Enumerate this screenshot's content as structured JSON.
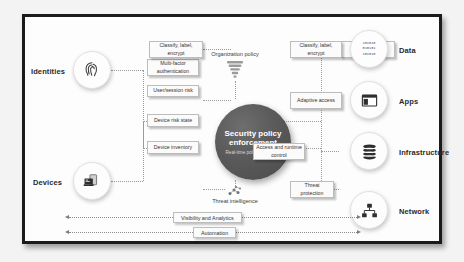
{
  "diagram": {
    "hub": {
      "name": "security-policy-enforcement",
      "title": "Security policy enforcement",
      "subtitle": "Real-time policy evaluation",
      "color": "#5a5a5a"
    },
    "top_annotation": {
      "label": "Organization policy",
      "icon": "funnel-icon"
    },
    "bottom_annotation": {
      "label": "Threat intelligence",
      "icon": "threat-intelligence-icon"
    },
    "signal_sources": [
      {
        "id": "identities",
        "label": "Identities",
        "icon": "fingerprint-icon",
        "controls": [
          "Multi-factor authentication",
          "User/session risk"
        ]
      },
      {
        "id": "devices",
        "label": "Devices",
        "icon": "device-icon",
        "controls": [
          "Device risk state",
          "Device inventory"
        ]
      }
    ],
    "protected_resources": [
      {
        "id": "data",
        "label": "Data",
        "icon": "binary-data-icon",
        "icon_text": [
          "101010",
          "010101",
          "101010"
        ],
        "control": "Classify, label, encrypt"
      },
      {
        "id": "apps",
        "label": "Apps",
        "icon": "app-window-icon",
        "control": "Adaptive access"
      },
      {
        "id": "infrastructure",
        "label": "Infrastructure",
        "icon": "database-icon",
        "control": "Access and runtime control"
      },
      {
        "id": "network",
        "label": "Network",
        "icon": "network-topology-icon",
        "control": "Threat protection"
      }
    ],
    "cross_cutting_bars": [
      {
        "id": "visibility-and-analytics",
        "label": "Visibility and Analytics"
      },
      {
        "id": "automation",
        "label": "Automation"
      }
    ],
    "colors": {
      "frame_border": "#1b1b1b",
      "canvas_background": "#f3f3f3",
      "panel_background": "#fdfdfd",
      "hub_fill": "#5a5a5a",
      "hub_text": "#ffffff",
      "connector": "#9a9a9a",
      "box_border": "#bdbdbd",
      "text": "#333333"
    }
  }
}
